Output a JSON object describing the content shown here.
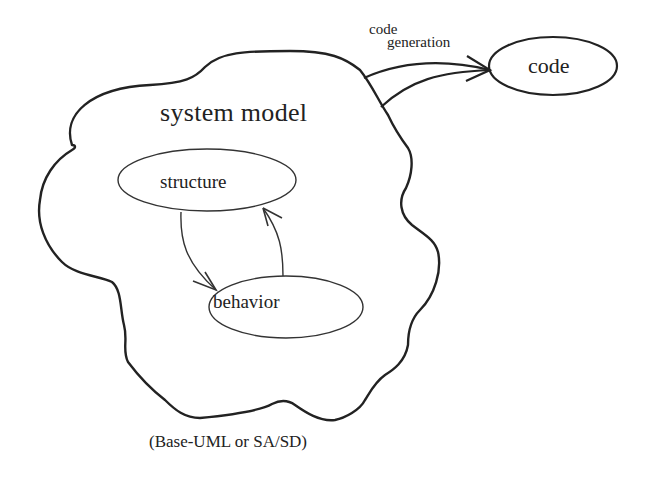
{
  "diagram": {
    "cloud": {
      "label": "system model"
    },
    "nodes": [
      {
        "id": "structure",
        "label": "structure"
      },
      {
        "id": "behavior",
        "label": "behavior"
      },
      {
        "id": "code",
        "label": "code"
      }
    ],
    "edges": [
      {
        "from": "structure",
        "to": "behavior"
      },
      {
        "from": "behavior",
        "to": "structure"
      },
      {
        "from": "system-model",
        "to": "code",
        "label_line1": "code",
        "label_line2": "generation"
      }
    ],
    "caption": "(Base-UML or SA/SD)",
    "colors": {
      "stroke": "#222222",
      "background": "#ffffff"
    }
  }
}
